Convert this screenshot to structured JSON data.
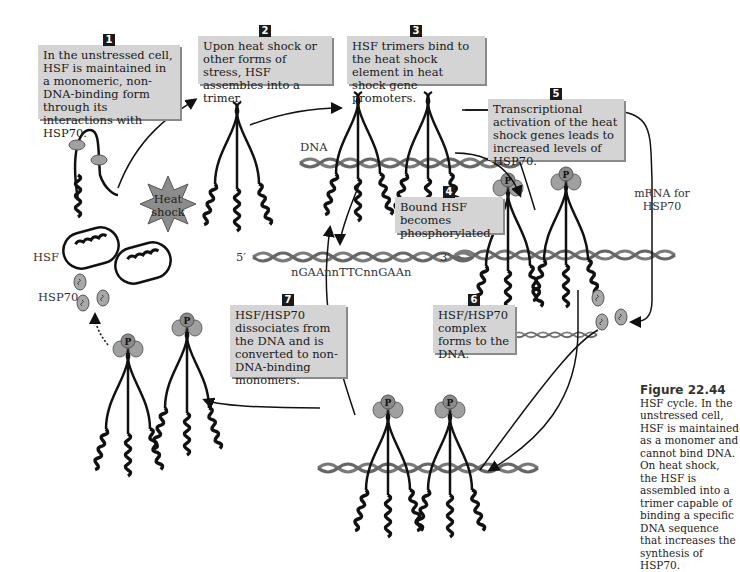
{
  "figure": {
    "caption_title": "Figure 22.44",
    "caption_text": "HSF cycle. In the unstressed cell, HSF is maintained as a monomer and cannot bind DNA. On heat shock, the HSF is assembled into a trimer capable of binding a specific DNA sequence that increases the synthesis of HSP70."
  },
  "steps": [
    {
      "number": "1",
      "text": "In the unstressed cell, HSF is maintained in a monomeric, non-DNA-binding form through its interactions with HSP70."
    },
    {
      "number": "2",
      "text": "Upon heat shock or other forms of stress, HSF assembles into a trimer."
    },
    {
      "number": "3",
      "text": "HSF trimers bind to the heat shock element in heat shock gene promoters."
    },
    {
      "number": "4",
      "text": "Bound HSF becomes phosphorylated."
    },
    {
      "number": "5",
      "text": "Transcriptional activation of the heat shock genes leads to increased levels of HSP70."
    },
    {
      "number": "6",
      "text": "HSF/HSP70 complex forms to the DNA."
    },
    {
      "number": "7",
      "text": "HSF/HSP70 dissociates from the DNA and is converted to non-DNA-binding monomers."
    }
  ],
  "labels": {
    "hsf": "HSF",
    "hsp70": "HSP70",
    "dna": "DNA",
    "heat_shock": "Heat shock",
    "mrna": "mRNA for HSP70",
    "five_prime": "5′",
    "three_prime": "3′",
    "sequence": "nGAAnnTTCnnGAAn",
    "phospho": "P"
  },
  "colors": {
    "box_fill": "#d4d4d4",
    "badge": "#1a1a1a",
    "protein": "#a0a0a0",
    "dna_strand": "#7a7a7a",
    "star": "#8c8c8c"
  }
}
